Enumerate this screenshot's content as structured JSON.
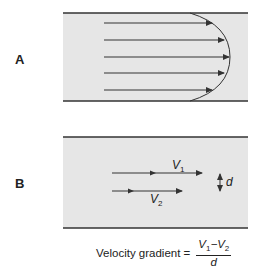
{
  "panels": {
    "a": {
      "label": "A",
      "description": "Laminar flow parabolic velocity profile"
    },
    "b": {
      "label": "B",
      "v1": {
        "symbol": "V",
        "subscript": "1"
      },
      "v2": {
        "symbol": "V",
        "subscript": "2"
      },
      "distance": "d"
    }
  },
  "formula": {
    "lhs": "Velocity gradient =",
    "numerator": "V1−V2",
    "numerator_parts": {
      "v1": "V",
      "v1_sub": "1",
      "minus": "−",
      "v2": "V",
      "v2_sub": "2"
    },
    "denominator": "d"
  },
  "colors": {
    "fluid": "#e6e6e6",
    "wall": "#333333",
    "arrow": "#333333"
  }
}
